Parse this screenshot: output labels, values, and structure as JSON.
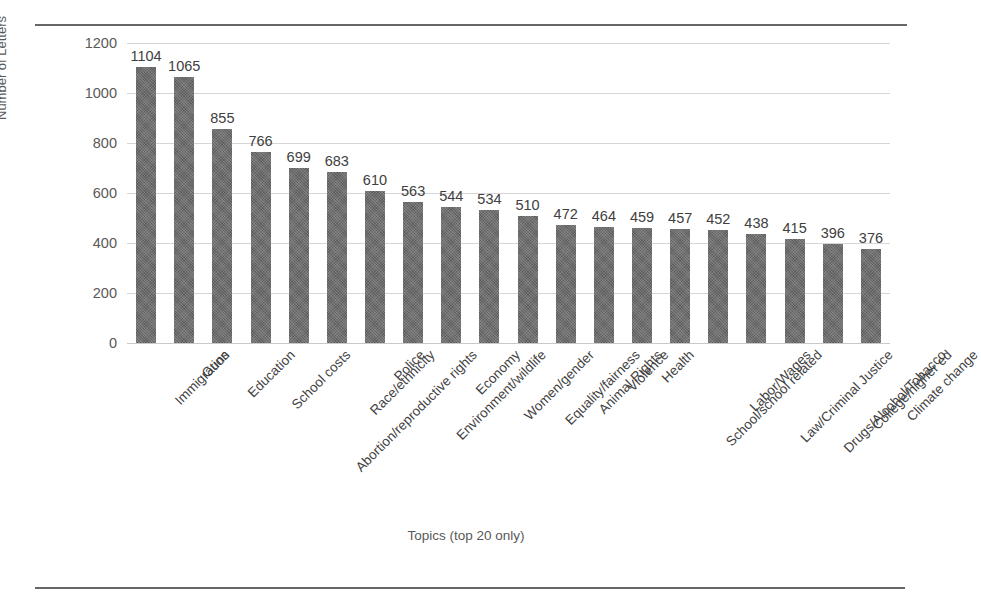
{
  "chart_data": {
    "type": "bar",
    "title": "",
    "xlabel": "Topics (top 20 only)",
    "ylabel": "Number of Letters",
    "ylim": [
      0,
      1200
    ],
    "yticks": [
      0,
      200,
      400,
      600,
      800,
      1000,
      1200
    ],
    "grid": true,
    "legend": false,
    "orientation": "vertical",
    "bar_color": "#5e5e5e",
    "data_labels": true,
    "categories": [
      "Immigration",
      "Guns",
      "Education",
      "School costs",
      "Abortion/reproductive rights",
      "Race/ethnicity",
      "Police",
      "Environment/wildlife",
      "Economy",
      "Women/gender",
      "Equality/fairness",
      "Animal Rights",
      "Violence",
      "Health",
      "School/school related",
      "Labor/Wages",
      "Law/Criminal Justice",
      "Drugs/Alcohol/Tobacco",
      "College/higher ed",
      "Climate change"
    ],
    "values": [
      1104,
      1065,
      855,
      766,
      699,
      683,
      610,
      563,
      544,
      534,
      510,
      472,
      464,
      459,
      457,
      452,
      438,
      415,
      396,
      376
    ]
  }
}
